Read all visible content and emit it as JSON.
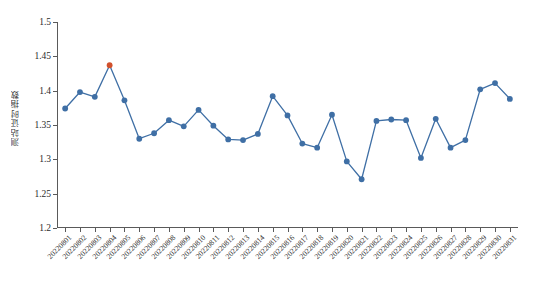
{
  "chart_data": {
    "type": "line",
    "title": "",
    "subtitle": "",
    "xlabel": "",
    "ylabel": "测站证时指数",
    "ylim": [
      1.2,
      1.5
    ],
    "ytick_values": [
      1.2,
      1.25,
      1.3,
      1.35,
      1.4,
      1.45,
      1.5
    ],
    "ytick_labels": [
      "1.2",
      "1.25",
      "1.3",
      "1.35",
      "1.4",
      "1.45",
      "1.5"
    ],
    "grid": false,
    "legend": null,
    "legend_position": "none",
    "marker": "circle",
    "line_color": "#3f6fa5",
    "marker_color": "#3f6fa5",
    "highlight_color": "#d1502c",
    "highlight_index": 3,
    "highlight_label": "20220804",
    "highlight_value": 1.437,
    "categories": [
      "20220801",
      "20220802",
      "20220803",
      "20220804",
      "20220805",
      "20220806",
      "20220807",
      "20220808",
      "20220809",
      "20220810",
      "20220811",
      "20220812",
      "20220813",
      "20220814",
      "20220815",
      "20220816",
      "20220817",
      "20220818",
      "20220819",
      "20220820",
      "20220821",
      "20220822",
      "20220823",
      "20220824",
      "20220825",
      "20220826",
      "20220827",
      "20220828",
      "20220829",
      "20220830",
      "20220831"
    ],
    "values": [
      1.374,
      1.398,
      1.391,
      1.437,
      1.386,
      1.33,
      1.338,
      1.357,
      1.348,
      1.372,
      1.349,
      1.329,
      1.328,
      1.337,
      1.392,
      1.364,
      1.323,
      1.317,
      1.365,
      1.297,
      1.271,
      1.356,
      1.358,
      1.357,
      1.302,
      1.359,
      1.317,
      1.328,
      1.402,
      1.411,
      1.388
    ]
  }
}
